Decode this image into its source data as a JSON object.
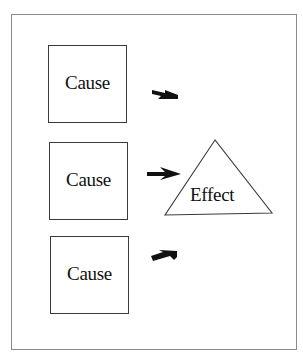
{
  "diagram": {
    "type": "cause-and-effect",
    "causes": [
      {
        "label": "Cause",
        "arrow": "arrow-down-right-icon"
      },
      {
        "label": "Cause",
        "arrow": "arrow-right-icon"
      },
      {
        "label": "Cause",
        "arrow": "arrow-up-right-icon"
      }
    ],
    "effect": {
      "label": "Effect",
      "shape": "triangle"
    },
    "colors": {
      "stroke": "#3a3a3a",
      "frame": "#8a8a8a",
      "arrow": "#111111",
      "background": "#ffffff"
    }
  }
}
